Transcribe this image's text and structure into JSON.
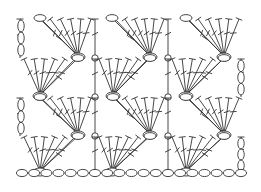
{
  "diagram": {
    "type": "crochet-stitch-chart",
    "stroke_color": "#333333",
    "background": "#ffffff",
    "grid": {
      "x_columns": [
        20,
        95,
        168,
        243
      ],
      "row_lines_y": [
        18,
        58,
        97,
        136
      ],
      "bottom_chain_y": 173
    },
    "fan_rows": [
      {
        "row": 0,
        "anchor_y": 58,
        "top_y": 18,
        "anchors_x": [
          78,
          150,
          224
        ],
        "top_ovals_x": [
          40,
          112,
          186
        ],
        "direction": "right"
      },
      {
        "row": 1,
        "anchor_y": 97,
        "top_y": 58,
        "anchors_x": [
          40,
          113,
          186
        ],
        "top_ovals_x": [
          78,
          150,
          224
        ],
        "direction": "left"
      },
      {
        "row": 2,
        "anchor_y": 136,
        "top_y": 97,
        "anchors_x": [
          78,
          150,
          224
        ],
        "top_ovals_x": [
          40,
          113,
          186
        ],
        "direction": "right"
      },
      {
        "row": 3,
        "anchor_y": 173,
        "top_y": 136,
        "anchors_x": [
          40,
          112,
          186
        ],
        "top_ovals_x": [
          78,
          150,
          224
        ],
        "direction": "left"
      }
    ],
    "side_chains": [
      {
        "side": "left",
        "x": 21,
        "y_from": 20,
        "y_to": 56,
        "count": 3
      },
      {
        "side": "right",
        "x": 241,
        "y_from": 60,
        "y_to": 95,
        "count": 3
      },
      {
        "side": "left",
        "x": 21,
        "y_from": 99,
        "y_to": 134,
        "count": 3
      },
      {
        "side": "right",
        "x": 241,
        "y_from": 138,
        "y_to": 171,
        "count": 3
      }
    ],
    "bottom_chain": {
      "count": 19,
      "x_from": 22,
      "x_to": 241,
      "y": 173
    },
    "stitch_legend": {
      "chain": "oval",
      "double_crochet": "T-stitch with crossbar",
      "slip_stitch": "small loop"
    }
  }
}
